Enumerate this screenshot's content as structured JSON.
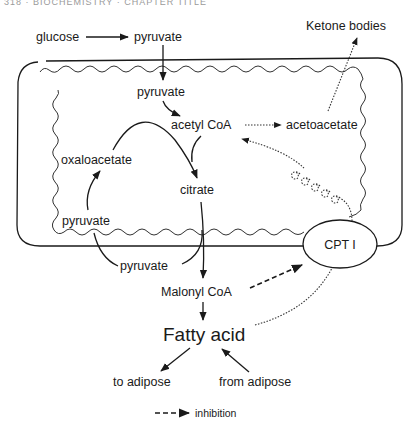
{
  "header": {
    "cropped_text": "318 · BIOCHEMISTRY · CHAPTER TITLE"
  },
  "diagram": {
    "compartment": "mitochondrion",
    "nodes": {
      "glucose": "glucose",
      "pyruvate_cytosol_top": "pyruvate",
      "ketone_bodies": "Ketone bodies",
      "pyruvate_mito": "pyruvate",
      "acetyl_coa": "acetyl CoA",
      "acetoacetate": "acetoacetate",
      "oxaloacetate": "oxaloacetate",
      "citrate": "citrate",
      "pyruvate_mito_lower": "pyruvate",
      "pyruvate_cytosol_lower": "pyruvate",
      "cpt1": "CPT I",
      "malonyl_coa": "Malonyl CoA",
      "fatty_acid": "Fatty acid",
      "to_adipose": "to adipose",
      "from_adipose": "from adipose"
    },
    "legend": {
      "inhibition": "inhibition"
    },
    "edges": [
      {
        "from": "glucose",
        "to": "pyruvate",
        "style": "solid"
      },
      {
        "from": "pyruvate (cytosol)",
        "to": "pyruvate (mitochondrion)",
        "style": "solid"
      },
      {
        "from": "pyruvate",
        "to": "acetyl CoA",
        "style": "solid"
      },
      {
        "from": "acetyl CoA",
        "to": "acetoacetate",
        "style": "dotted"
      },
      {
        "from": "acetoacetate",
        "to": "Ketone bodies",
        "style": "dotted"
      },
      {
        "from": "oxaloacetate",
        "to": "citrate",
        "style": "solid"
      },
      {
        "from": "acetyl CoA",
        "to": "citrate",
        "style": "solid"
      },
      {
        "from": "pyruvate",
        "to": "oxaloacetate",
        "style": "solid"
      },
      {
        "from": "citrate",
        "to": "Malonyl CoA",
        "style": "solid"
      },
      {
        "from": "Malonyl CoA",
        "to": "Fatty acid",
        "style": "solid"
      },
      {
        "from": "Malonyl CoA",
        "to": "CPT I",
        "style": "dashed",
        "meaning": "inhibition"
      },
      {
        "from": "Fatty acid",
        "to": "CPT I",
        "style": "dotted"
      },
      {
        "from": "CPT I",
        "to": "acetyl CoA",
        "style": "dotted",
        "via": "helix"
      },
      {
        "from": "Fatty acid",
        "to": "to adipose",
        "style": "solid"
      },
      {
        "from": "from adipose",
        "to": "Fatty acid",
        "style": "solid"
      }
    ]
  }
}
